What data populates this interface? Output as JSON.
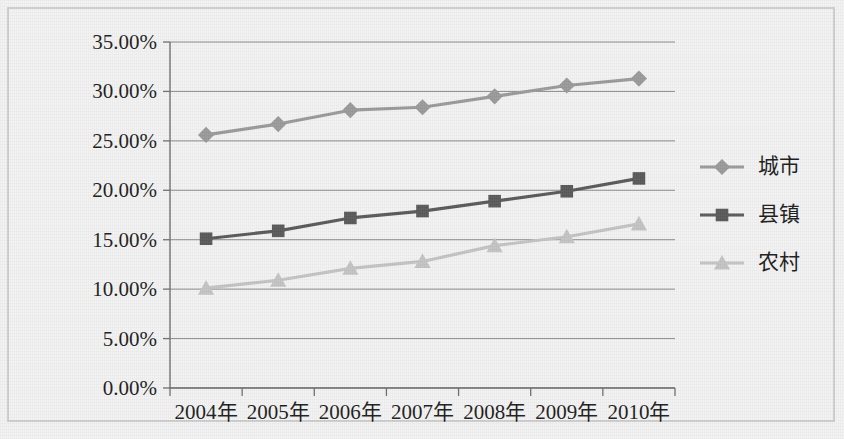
{
  "chart_data": {
    "type": "line",
    "title": "",
    "subtitle": "",
    "xlabel": "",
    "ylabel": "",
    "categories": [
      "2004年",
      "2005年",
      "2006年",
      "2007年",
      "2008年",
      "2009年",
      "2010年"
    ],
    "ylim": [
      0,
      35
    ],
    "y_ticks": [
      0,
      5,
      10,
      15,
      20,
      25,
      30,
      35
    ],
    "y_tick_labels": [
      "0.00%",
      "5.00%",
      "10.00%",
      "15.00%",
      "20.00%",
      "25.00%",
      "30.00%",
      "35.00%"
    ],
    "y_unit": "%",
    "grid": {
      "horizontal": true,
      "vertical": false
    },
    "legend": {
      "position": "right",
      "entries": [
        "城市",
        "县镇",
        "农村"
      ]
    },
    "series": [
      {
        "name": "城市",
        "marker": "diamond",
        "color": "#9a9a9a",
        "values": [
          25.6,
          26.7,
          28.1,
          28.4,
          29.5,
          30.6,
          31.3
        ]
      },
      {
        "name": "县镇",
        "marker": "square",
        "color": "#595959",
        "values": [
          15.1,
          15.9,
          17.2,
          17.9,
          18.9,
          19.9,
          21.2
        ]
      },
      {
        "name": "农村",
        "marker": "triangle",
        "color": "#c4c4c4",
        "values": [
          10.1,
          10.9,
          12.1,
          12.8,
          14.4,
          15.3,
          16.6
        ]
      }
    ]
  },
  "figure": {
    "background_color": "#f3f3f3",
    "border_color": "#cfcfcf",
    "gridline_color": "#8a8a8a",
    "axis_color": "#6f6f6f",
    "text_color": "#1c1c1c"
  }
}
